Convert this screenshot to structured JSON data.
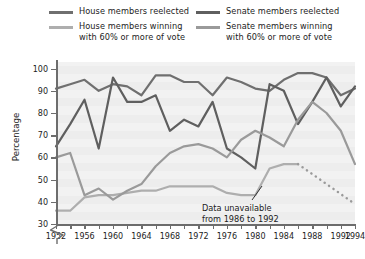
{
  "legend": {
    "left": [
      {
        "label": "House members reelected",
        "color": "#6f6f6f",
        "name": "legend-house-reelected"
      },
      {
        "label": "House members winning\nwith 60% or more of vote",
        "color": "#aeaeae",
        "name": "legend-house-60pct"
      }
    ],
    "right": [
      {
        "label": "Senate members reelected",
        "color": "#5f5f5f",
        "name": "legend-senate-reelected"
      },
      {
        "label": "Senate members winning\nwith 60% or more of vote",
        "color": "#9a9a9a",
        "name": "legend-senate-60pct"
      }
    ]
  },
  "annotation": {
    "text": "Data unavailable\nfrom 1986 to 1992"
  },
  "chart_data": {
    "type": "line",
    "title": "",
    "xlabel": "",
    "ylabel": "Percentage",
    "ylim": [
      30,
      103
    ],
    "yticks": [
      30,
      40,
      50,
      60,
      70,
      80,
      90,
      100
    ],
    "axis_break": true,
    "axis_break_note": "y-axis broken below 30",
    "grid": true,
    "legend_position": "top",
    "xlim": [
      1952,
      1994
    ],
    "xticks": [
      1952,
      1956,
      1960,
      1964,
      1968,
      1972,
      1976,
      1980,
      1984,
      1988,
      1992,
      1994
    ],
    "x": [
      1952,
      1954,
      1956,
      1958,
      1960,
      1962,
      1964,
      1966,
      1968,
      1970,
      1972,
      1974,
      1976,
      1978,
      1980,
      1982,
      1984,
      1986,
      1988,
      1990,
      1992,
      1994
    ],
    "series": [
      {
        "name": "House members reelected",
        "color": "#6f6f6f",
        "values": [
          91,
          93,
          95,
          90,
          93,
          92,
          88,
          97,
          97,
          94,
          94,
          88,
          96,
          94,
          91,
          90,
          95,
          98,
          98,
          96,
          88,
          91
        ]
      },
      {
        "name": "House members winning with 60% or more of vote",
        "color": "#aeaeae",
        "values": [
          36,
          36,
          42,
          43,
          43,
          44,
          45,
          45,
          47,
          47,
          47,
          47,
          44,
          43,
          43,
          55,
          57,
          57,
          57,
          57,
          57,
          57
        ],
        "dashed_from": 1986,
        "dashed_note": "dotted segment 1986-1994 indicates unavailable data"
      },
      {
        "name": "Senate members reelected",
        "color": "#5f5f5f",
        "values": [
          65,
          75,
          86,
          64,
          96,
          85,
          85,
          88,
          72,
          77,
          74,
          85,
          64,
          60,
          55,
          93,
          90,
          75,
          85,
          96,
          83,
          92
        ]
      },
      {
        "name": "Senate members winning with 60% or more of vote",
        "color": "#9a9a9a",
        "values": [
          60,
          62,
          43,
          46,
          41,
          45,
          48,
          56,
          62,
          65,
          66,
          64,
          60,
          68,
          72,
          69,
          65,
          77,
          85,
          80,
          72,
          57
        ]
      }
    ],
    "dotted_guide": {
      "name": "data-unavailable-dotted",
      "color": "#9a9a9a",
      "from_year": 1986,
      "to_year": 1994,
      "from_value": 57,
      "to_value": 39
    }
  }
}
